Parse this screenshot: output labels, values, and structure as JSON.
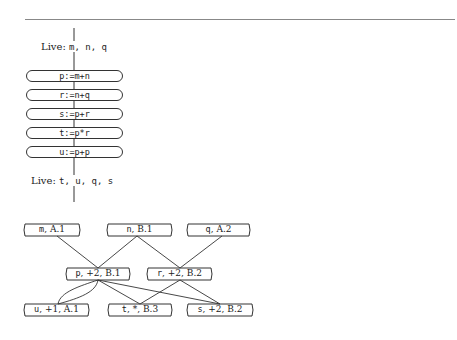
{
  "live_in": {
    "label": "Live:",
    "vars": "m, n, q"
  },
  "statements": [
    {
      "text": "p:=m+n"
    },
    {
      "text": "r:=n+q"
    },
    {
      "text": "s:=p+r"
    },
    {
      "text": "t:=p*r"
    },
    {
      "text": "u:=p+p"
    }
  ],
  "live_out": {
    "label": "Live:",
    "vars": "t, u, q, s"
  },
  "dag": {
    "nodes": [
      {
        "id": "m",
        "var": "m",
        "info": ", A.1"
      },
      {
        "id": "n",
        "var": "n",
        "info": ", B.1"
      },
      {
        "id": "q",
        "var": "q",
        "info": ", A.2"
      },
      {
        "id": "p",
        "var": "p",
        "info": ", +2, B.1"
      },
      {
        "id": "r",
        "var": "r",
        "info": ", +2, B.2"
      },
      {
        "id": "u",
        "var": "u",
        "info": ", +1, A.1"
      },
      {
        "id": "t",
        "var": "t",
        "info": ", *, B.3"
      },
      {
        "id": "s",
        "var": "s",
        "info": ", +2, B.2"
      }
    ],
    "edges": [
      [
        "m",
        "p"
      ],
      [
        "n",
        "p"
      ],
      [
        "n",
        "r"
      ],
      [
        "q",
        "r"
      ],
      [
        "p",
        "u"
      ],
      [
        "p",
        "u"
      ],
      [
        "p",
        "t"
      ],
      [
        "r",
        "t"
      ],
      [
        "p",
        "s"
      ],
      [
        "r",
        "s"
      ]
    ]
  }
}
